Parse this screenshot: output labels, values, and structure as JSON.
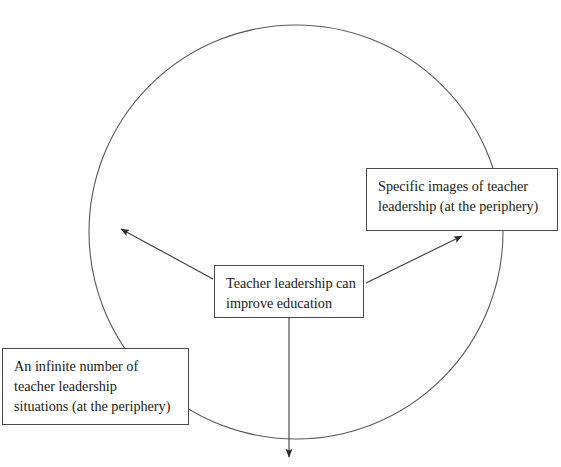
{
  "diagram": {
    "caption": "",
    "circle": {
      "name": "periphery-circle",
      "center_x": 296,
      "center_y": 232,
      "radius": 207,
      "stroke": "#5a5a5a",
      "stroke_width": 1.1,
      "fill": "none"
    },
    "nodes": [
      {
        "id": "specific-images",
        "lines": [
          "Specific images of teacher",
          "leadership (at the periphery)"
        ],
        "x": 366,
        "y": 168,
        "width": 192,
        "height": 63
      },
      {
        "id": "teacher-leadership-improves",
        "lines": [
          "Teacher leadership can",
          "improve education"
        ],
        "x": 214,
        "y": 265,
        "width": 150,
        "height": 53
      },
      {
        "id": "infinite-situations",
        "lines": [
          "An infinite number of",
          "teacher leadership",
          "situations (at the periphery)"
        ],
        "x": 2,
        "y": 348,
        "width": 187,
        "height": 77
      }
    ],
    "arrows": [
      {
        "id": "arrow-to-upper-left",
        "from_x": 213,
        "from_y": 279,
        "to_x": 117,
        "to_y": 226,
        "stroke": "#3c3c3c"
      },
      {
        "id": "arrow-to-specific-images",
        "from_x": 366,
        "from_y": 283,
        "to_x": 466,
        "to_y": 233,
        "stroke": "#3c3c3c"
      },
      {
        "id": "arrow-downward",
        "from_x": 289,
        "from_y": 318,
        "to_x": 289,
        "to_y": 461,
        "stroke": "#3c3c3c"
      }
    ],
    "colors": {
      "stroke": "#4a4a4a",
      "text": "#1a1a1a",
      "background": "#ffffff"
    }
  }
}
